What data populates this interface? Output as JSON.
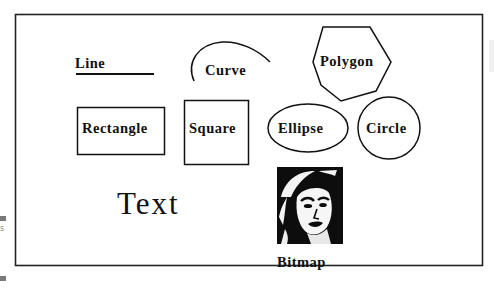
{
  "figure": {
    "labels": {
      "line": "Line",
      "curve": "Curve",
      "polygon": "Polygon",
      "rectangle": "Rectangle",
      "square": "Square",
      "ellipse": "Ellipse",
      "circle": "Circle",
      "text": "Text",
      "bitmap": "Bitmap"
    },
    "colors": {
      "stroke": "#111111",
      "background": "#ffffff",
      "edge_marks": "#7a7a7a"
    },
    "edge_fragment": "s"
  }
}
